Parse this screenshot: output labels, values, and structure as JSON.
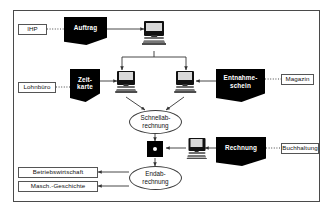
{
  "diagram": {
    "language": "de",
    "frame": {
      "border_color": "#4a4a4a",
      "background": "#ffffff"
    },
    "roles": [
      {
        "id": "ihp",
        "label": "IHP"
      },
      {
        "id": "lohnbuero",
        "label": "Lohnbüro"
      },
      {
        "id": "magazin",
        "label": "Magazin"
      },
      {
        "id": "buchhaltung",
        "label": "Buchhaltung"
      },
      {
        "id": "betriebswirtschaft",
        "label": "Betriebswirtschaft"
      },
      {
        "id": "masch-geschichte",
        "label": "Masch.-Geschichte"
      }
    ],
    "documents": [
      {
        "id": "auftrag",
        "label": "Auftrag"
      },
      {
        "id": "zeitkarte",
        "line1": "Zeit-",
        "line2": "karte"
      },
      {
        "id": "entnahmeschein",
        "line1": "Entnahme-",
        "line2": "schein"
      },
      {
        "id": "rechnung",
        "label": "Rechnung"
      }
    ],
    "processes": [
      {
        "id": "schnellabrechnung",
        "line1": "Schnellab-",
        "line2": "rechnung"
      },
      {
        "id": "endabrechnung",
        "line1": "Endab-",
        "line2": "rechnung"
      }
    ],
    "terminals": [
      {
        "id": "terminal-top",
        "icon": "computer-icon"
      },
      {
        "id": "terminal-left",
        "icon": "computer-icon"
      },
      {
        "id": "terminal-right",
        "icon": "computer-icon"
      },
      {
        "id": "terminal-invoice",
        "icon": "computer-icon"
      }
    ],
    "nodes": [
      {
        "id": "merge-node",
        "shape": "square-with-dot"
      }
    ],
    "colors": {
      "document_fill": "#000000",
      "document_text": "#ffffff",
      "line": "#333333",
      "frame": "#4a4a4a"
    }
  }
}
